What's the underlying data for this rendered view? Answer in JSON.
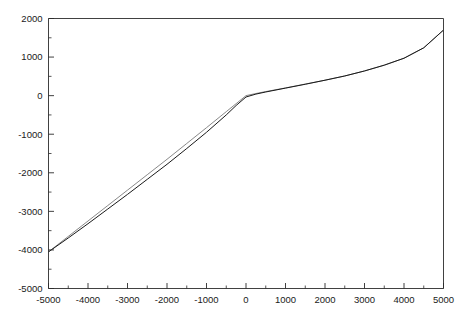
{
  "figure": {
    "background_color": "#ffffff",
    "width": 464,
    "height": 318
  },
  "chart_data": {
    "type": "line",
    "title": "",
    "subtitle": "",
    "xlabel": "",
    "ylabel": "",
    "xlim": [
      -5000,
      5000
    ],
    "ylim": [
      -5000,
      2000
    ],
    "grid": false,
    "legend": false,
    "legend_position": "none",
    "frame": "box",
    "tick_direction": "in",
    "x_major_ticks": [
      -5000,
      -4000,
      -3000,
      -2000,
      -1000,
      0,
      1000,
      2000,
      3000,
      4000,
      5000
    ],
    "x_tick_labels": [
      "-5000",
      "-4000",
      "-3000",
      "-2000",
      "-1000",
      "0",
      "1000",
      "2000",
      "3000",
      "4000",
      "5000"
    ],
    "x_minor_ticks": [
      -4500,
      -3500,
      -2500,
      -1500,
      -500,
      500,
      1500,
      2500,
      3500,
      4500
    ],
    "y_major_ticks": [
      -5000,
      -4000,
      -3000,
      -2000,
      -1000,
      0,
      1000,
      2000
    ],
    "y_tick_labels": [
      "-5000",
      "-4000",
      "-3000",
      "-2000",
      "-1000",
      "0",
      "1000",
      "2000"
    ],
    "y_minor_ticks": [
      -4500,
      -3500,
      -2500,
      -1500,
      -500,
      500,
      1500
    ],
    "series": [
      {
        "name": "curve-upper",
        "color": "#7a7a7a",
        "line_width": 0.9,
        "x": [
          -5000,
          -4500,
          -4000,
          -3500,
          -3000,
          -2500,
          -2000,
          -1500,
          -1000,
          -500,
          -250,
          0,
          250,
          500,
          1000,
          1500,
          2000,
          2500,
          3000,
          3500,
          4000,
          4500,
          5000
        ],
        "y": [
          -4050,
          -3650,
          -3250,
          -2850,
          -2450,
          -2050,
          -1650,
          -1240,
          -830,
          -415,
          -208,
          0,
          55,
          105,
          200,
          300,
          400,
          510,
          640,
          790,
          970,
          1240,
          1700
        ]
      },
      {
        "name": "curve-lower",
        "color": "#1a1a1a",
        "line_width": 1.0,
        "x": [
          -5000,
          -4500,
          -4000,
          -3500,
          -3000,
          -2500,
          -2000,
          -1500,
          -1000,
          -500,
          -250,
          0,
          250,
          500,
          1000,
          1500,
          2000,
          2500,
          3000,
          3500,
          4000,
          4500,
          5000
        ],
        "y": [
          -4050,
          -3690,
          -3320,
          -2940,
          -2560,
          -2170,
          -1780,
          -1370,
          -950,
          -500,
          -255,
          -35,
          40,
          95,
          195,
          295,
          400,
          510,
          640,
          790,
          970,
          1240,
          1700
        ]
      }
    ]
  }
}
